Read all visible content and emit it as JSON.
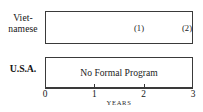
{
  "chart_data": {
    "type": "bar",
    "orientation": "horizontal",
    "title": "",
    "xlabel": "YEARS",
    "ylabel": "",
    "xlim": [
      0,
      3
    ],
    "xticks": [
      0,
      1,
      2,
      3
    ],
    "xtick_labels": [
      "0",
      "1",
      "2",
      "3"
    ],
    "grid": false,
    "legend": false,
    "categories": [
      "Viet-\nnamese",
      "U.S.A."
    ],
    "values": [
      3,
      3
    ],
    "bars": [
      {
        "category_label_line1": "Viet-",
        "category_label_line2": "namese",
        "start": 0,
        "end": 3,
        "duration": 3,
        "fill": "none",
        "inner_text": "",
        "annotations": [
          {
            "label": "(1)",
            "x": 1.88
          },
          {
            "label": "(2)",
            "x": 2.92
          }
        ]
      },
      {
        "category_label_line1": "U.S.A.",
        "category_label_line2": "",
        "start": 0,
        "end": 3,
        "duration": 3,
        "fill": "none",
        "inner_text": "No Formal Program",
        "annotations": []
      }
    ]
  },
  "figure": {
    "axis_title": "YEARS",
    "tick_labels": [
      "0",
      "1",
      "2",
      "3"
    ],
    "rows": {
      "vietnamese": {
        "label_line1": "Viet-",
        "label_line2": "namese",
        "marker_1": "(1)",
        "marker_2": "(2)"
      },
      "usa": {
        "label": "U.S.A.",
        "bar_text": "No Formal Program"
      }
    },
    "colors": {
      "ink": "#1c1c1c",
      "rule": "#3a3a3a",
      "paper": "#ffffff"
    }
  }
}
